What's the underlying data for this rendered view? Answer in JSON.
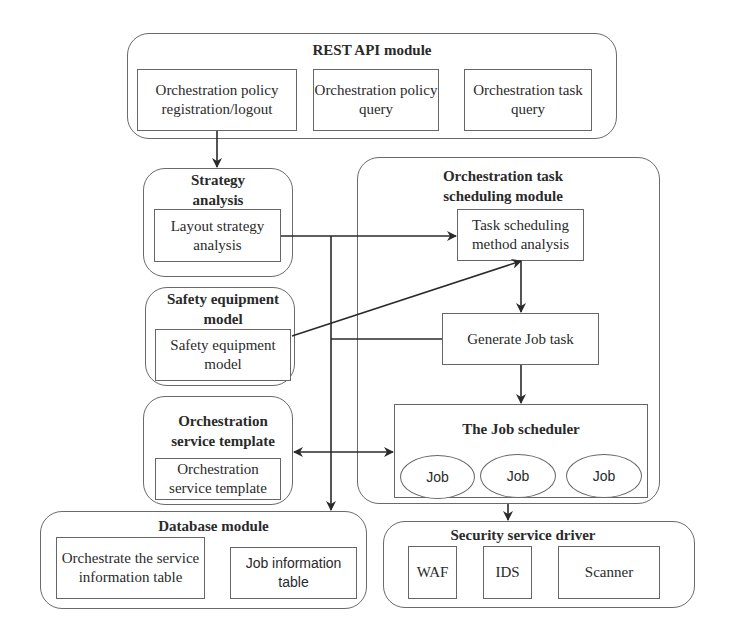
{
  "rest_api_module": {
    "title": "REST API module",
    "items": [
      "Orchestration policy registration/logout",
      "Orchestration policy query",
      "Orchestration task query"
    ]
  },
  "strategy_analysis": {
    "title": "Strategy analysis",
    "item": "Layout strategy analysis"
  },
  "safety_equipment_model": {
    "title": "Safety equipment model",
    "item": "Safety equipment model"
  },
  "orchestration_service_template": {
    "title": "Orchestration service template",
    "item": "Orchestration service template"
  },
  "task_scheduling_module": {
    "title": "Orchestration task scheduling module",
    "method_analysis": "Task scheduling method analysis",
    "generate_job": "Generate Job task",
    "job_scheduler": {
      "title": "The Job scheduler",
      "jobs": [
        "Job",
        "Job",
        "Job"
      ]
    }
  },
  "database_module": {
    "title": "Database module",
    "items": [
      "Orchestrate the service information table",
      "Job information table"
    ]
  },
  "security_service_driver": {
    "title": "Security service driver",
    "items": [
      "WAF",
      "IDS",
      "Scanner"
    ]
  },
  "colors": {
    "line": "#2a2a2a",
    "border": "#666666",
    "background": "#ffffff"
  }
}
